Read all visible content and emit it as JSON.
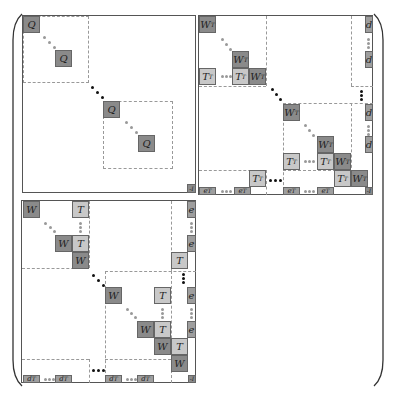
{
  "figure": {
    "colors": {
      "dark_cell": "#8a8a8a",
      "light_cell": "#c8c8c8",
      "border": "#555555",
      "dash": "#999999"
    }
  },
  "blocks": {
    "top_left": {
      "cells": [
        "Q",
        "Q",
        "Q",
        "Q"
      ],
      "corner": "-I"
    },
    "top_right": {
      "cells": {
        "w1": "W",
        "w1_sup": "T",
        "w2": "W",
        "w2_sup": "T",
        "t1": "T",
        "t1_sup": "T",
        "t2": "T",
        "t2_sup": "T",
        "w3": "W",
        "w3_sup": "T",
        "w4": "W",
        "w4_sup": "T",
        "w5": "W",
        "w5_sup": "T",
        "t3": "T",
        "t3_sup": "T",
        "t4": "T",
        "t4_sup": "T",
        "w6": "W",
        "w6_sup": "T",
        "t5": "T",
        "t5_sup": "T",
        "w7": "W",
        "w7_sup": "T",
        "t6": "T",
        "t6_sup": "T",
        "d1": "d",
        "d2": "d",
        "d3": "d",
        "d4": "d",
        "e1": "e",
        "e1_sup": "T",
        "e2": "e",
        "e2_sup": "T",
        "e3": "e",
        "e3_sup": "T",
        "e4": "e",
        "e4_sup": "T"
      },
      "corner": "-I"
    },
    "bottom_left": {
      "cells": {
        "w1": "W",
        "t1": "T",
        "w2": "W",
        "t2": "T",
        "w3": "W",
        "w4": "W",
        "t3": "T",
        "w5": "W",
        "t4": "T",
        "w6": "W",
        "t5": "T",
        "t6": "T",
        "e1": "e",
        "e2": "e",
        "e3": "e",
        "e4": "e",
        "d1": "d",
        "d1_sup": "T",
        "d2": "d",
        "d2_sup": "T",
        "d3": "d",
        "d3_sup": "T",
        "d4": "d",
        "d4_sup": "T"
      },
      "corner": "-I"
    }
  }
}
